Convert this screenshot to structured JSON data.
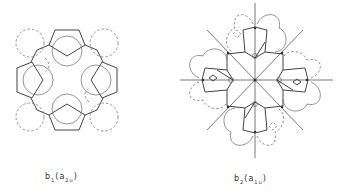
{
  "figure": {
    "panels": [
      {
        "id": "b1",
        "label_main": "b",
        "label_main_sub": "1",
        "label_paren_open": "(",
        "label_sym": "a",
        "label_sym_sub": "2u",
        "label_paren_close": ")",
        "description": "Molecular orbital lobes with four pentagon units, solid and dashed circles"
      },
      {
        "id": "b2",
        "label_main": "b",
        "label_main_sub": "2",
        "label_paren_open": "(",
        "label_sym": "a",
        "label_sym_sub": "1u",
        "label_paren_close": ")",
        "description": "Molecular orbital lobes with nodal planes (8 radial lines), solid and dashed lobes"
      }
    ],
    "colors": {
      "line": "#444444",
      "dashed": "#777777",
      "background": "#ffffff"
    }
  }
}
